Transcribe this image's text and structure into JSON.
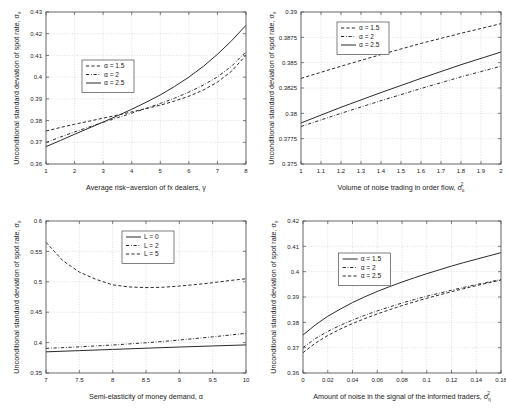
{
  "figure": {
    "title": "",
    "panel_count": 4
  },
  "chart_data": [
    {
      "id": "top-left",
      "type": "line",
      "title": "",
      "xlabel": "Average risk−aversion of fx dealers, γ",
      "ylabel": "Unconditional standard deviation of spot rate, σ",
      "ylabel_sub": "e",
      "xlim": [
        1,
        8
      ],
      "ylim": [
        0.36,
        0.43
      ],
      "xticks": [
        "1",
        "2",
        "3",
        "4",
        "5",
        "6",
        "7",
        "8"
      ],
      "xtickvals": [
        1,
        2,
        3,
        4,
        5,
        6,
        7,
        8
      ],
      "yticks": [
        "0.36",
        "0.37",
        "0.38",
        "0.39",
        "0.4",
        "0.41",
        "0.42",
        "0.43"
      ],
      "ytickvals": [
        0.36,
        0.37,
        0.38,
        0.39,
        0.4,
        0.41,
        0.42,
        0.43
      ],
      "grid": true,
      "legend_position": "north-west-inset",
      "series": [
        {
          "name": "α = 1.5",
          "style": "dashed",
          "x": [
            1,
            1.5,
            2,
            2.5,
            3,
            3.5,
            4,
            4.5,
            5,
            5.5,
            6,
            6.5,
            7,
            7.5,
            8
          ],
          "values": [
            0.3752,
            0.3768,
            0.3783,
            0.3797,
            0.3811,
            0.3825,
            0.384,
            0.3855,
            0.3871,
            0.389,
            0.3912,
            0.394,
            0.3977,
            0.4028,
            0.4101
          ]
        },
        {
          "name": "α = 2",
          "style": "dashdot",
          "x": [
            1,
            1.5,
            2,
            2.5,
            3,
            3.5,
            4,
            4.5,
            5,
            5.5,
            6,
            6.5,
            7,
            7.5,
            8
          ],
          "values": [
            0.3699,
            0.3724,
            0.3748,
            0.377,
            0.3792,
            0.3813,
            0.3834,
            0.3856,
            0.3879,
            0.3903,
            0.3931,
            0.3963,
            0.4001,
            0.4051,
            0.4117
          ]
        },
        {
          "name": "α = 2.5",
          "style": "solid",
          "x": [
            1,
            1.5,
            2,
            2.5,
            3,
            3.5,
            4,
            4.5,
            5,
            5.5,
            6,
            6.5,
            7,
            7.5,
            8
          ],
          "values": [
            0.368,
            0.3708,
            0.3737,
            0.3765,
            0.3793,
            0.3822,
            0.3852,
            0.3884,
            0.3918,
            0.3957,
            0.4,
            0.4049,
            0.4105,
            0.4168,
            0.4239
          ]
        }
      ]
    },
    {
      "id": "top-right",
      "type": "line",
      "title": "",
      "xlabel": "Volume of noise trading in order flow, σ",
      "xlabel_sub": "u",
      "xlabel_sup": "2",
      "ylabel": "Unconditional standard deviation of spot rate, σ",
      "ylabel_sub": "e",
      "xlim": [
        1,
        2
      ],
      "ylim": [
        0.375,
        0.39
      ],
      "xticks": [
        "1",
        "1.1",
        "1.2",
        "1.3",
        "1.4",
        "1.5",
        "1.6",
        "1.7",
        "1.8",
        "1.9",
        "2"
      ],
      "xtickvals": [
        1,
        1.1,
        1.2,
        1.3,
        1.4,
        1.5,
        1.6,
        1.7,
        1.8,
        1.9,
        2
      ],
      "yticks": [
        "0.375",
        "0.3775",
        "0.38",
        "0.3825",
        "0.385",
        "0.3875",
        "0.39"
      ],
      "ytickvals": [
        0.375,
        0.3775,
        0.38,
        0.3825,
        0.385,
        0.3875,
        0.39
      ],
      "grid": true,
      "legend_position": "north-west-inset",
      "series": [
        {
          "name": "α = 1.5",
          "style": "dashed",
          "x": [
            1,
            1.2,
            1.4,
            1.6,
            1.8,
            2
          ],
          "values": [
            0.38345,
            0.38465,
            0.3858,
            0.3869,
            0.3879,
            0.38885
          ]
        },
        {
          "name": "α = 2",
          "style": "dashdot",
          "x": [
            1,
            1.2,
            1.4,
            1.6,
            1.8,
            2
          ],
          "values": [
            0.3787,
            0.38,
            0.38125,
            0.38245,
            0.3836,
            0.38465
          ]
        },
        {
          "name": "α = 2.5",
          "style": "solid",
          "x": [
            1,
            1.2,
            1.4,
            1.6,
            1.8,
            2
          ],
          "values": [
            0.37905,
            0.3806,
            0.38205,
            0.38345,
            0.3848,
            0.38605
          ]
        }
      ]
    },
    {
      "id": "bottom-left",
      "type": "line",
      "title": "",
      "xlabel": "Semi-elasticity of money demand, α",
      "ylabel": "Unconditional standard deviation of spot rate, σ",
      "ylabel_sub": "e",
      "xlim": [
        7,
        10
      ],
      "ylim": [
        0.35,
        0.6
      ],
      "xticks": [
        "7",
        "7.5",
        "8",
        "8.5",
        "9",
        "9.5",
        "10"
      ],
      "xtickvals": [
        7,
        7.5,
        8,
        8.5,
        9,
        9.5,
        10
      ],
      "yticks": [
        "0.35",
        "0.4",
        "0.45",
        "0.5",
        "0.55",
        "0.6"
      ],
      "ytickvals": [
        0.35,
        0.4,
        0.45,
        0.5,
        0.55,
        0.6
      ],
      "grid": true,
      "legend_position": "north-center-inset",
      "series": [
        {
          "name": "L = 0",
          "style": "solid",
          "x": [
            7,
            7.5,
            8,
            8.5,
            9,
            9.5,
            10
          ],
          "values": [
            0.3848,
            0.3868,
            0.3888,
            0.3908,
            0.3927,
            0.3945,
            0.3962
          ]
        },
        {
          "name": "L = 2",
          "style": "dashdot",
          "x": [
            7,
            7.5,
            8,
            8.5,
            9,
            9.5,
            10
          ],
          "values": [
            0.3905,
            0.393,
            0.396,
            0.3997,
            0.4042,
            0.4094,
            0.4152
          ]
        },
        {
          "name": "L = 5",
          "style": "dashed",
          "x": [
            7,
            7.25,
            7.5,
            7.75,
            8,
            8.25,
            8.5,
            8.75,
            9,
            9.25,
            9.5,
            9.75,
            10
          ],
          "values": [
            0.565,
            0.535,
            0.516,
            0.504,
            0.495,
            0.4915,
            0.4905,
            0.491,
            0.493,
            0.4955,
            0.4985,
            0.502,
            0.505
          ]
        }
      ]
    },
    {
      "id": "bottom-right",
      "type": "line",
      "title": "",
      "xlabel": "Amount of noise in the signal of the informed traders, σ",
      "xlabel_sub": "η",
      "xlabel_sup": "2",
      "ylabel": "Unconditional standard deviation of spot rate, σ",
      "ylabel_sub": "e",
      "xlim": [
        0,
        0.16
      ],
      "ylim": [
        0.36,
        0.42
      ],
      "xticks": [
        "0",
        "0.02",
        "0.04",
        "0.06",
        "0.08",
        "0.1",
        "0.12",
        "0.14",
        "0.16"
      ],
      "xtickvals": [
        0,
        0.02,
        0.04,
        0.06,
        0.08,
        0.1,
        0.12,
        0.14,
        0.16
      ],
      "yticks": [
        "0.36",
        "0.37",
        "0.38",
        "0.39",
        "0.4",
        "0.41",
        "0.42"
      ],
      "ytickvals": [
        0.36,
        0.37,
        0.38,
        0.39,
        0.4,
        0.41,
        0.42
      ],
      "grid": true,
      "legend_position": "north-west-inset",
      "series": [
        {
          "name": "α = 1.5",
          "style": "solid",
          "x": [
            0,
            0.01,
            0.02,
            0.03,
            0.04,
            0.05,
            0.06,
            0.07,
            0.08,
            0.09,
            0.1,
            0.11,
            0.12,
            0.13,
            0.14,
            0.15,
            0.16
          ],
          "values": [
            0.375,
            0.379,
            0.3824,
            0.3852,
            0.3878,
            0.3901,
            0.3922,
            0.3941,
            0.3959,
            0.3976,
            0.3992,
            0.4007,
            0.4022,
            0.4036,
            0.4049,
            0.4062,
            0.4075
          ]
        },
        {
          "name": "α = 2",
          "style": "dashdot",
          "x": [
            0,
            0.01,
            0.02,
            0.03,
            0.04,
            0.05,
            0.06,
            0.07,
            0.08,
            0.09,
            0.1,
            0.11,
            0.12,
            0.13,
            0.14,
            0.15,
            0.16
          ],
          "values": [
            0.37,
            0.3736,
            0.3764,
            0.3788,
            0.3809,
            0.3828,
            0.3845,
            0.3861,
            0.3876,
            0.389,
            0.3903,
            0.3915,
            0.3927,
            0.3938,
            0.3949,
            0.3959,
            0.3969
          ]
        },
        {
          "name": "α = 2.5",
          "style": "dashed",
          "x": [
            0,
            0.01,
            0.02,
            0.03,
            0.04,
            0.05,
            0.06,
            0.07,
            0.08,
            0.09,
            0.1,
            0.11,
            0.12,
            0.13,
            0.14,
            0.15,
            0.16
          ],
          "values": [
            0.368,
            0.3718,
            0.3748,
            0.3773,
            0.3795,
            0.3815,
            0.3833,
            0.385,
            0.3866,
            0.3881,
            0.3895,
            0.3908,
            0.3921,
            0.3933,
            0.3945,
            0.3956,
            0.3967
          ]
        }
      ]
    }
  ]
}
